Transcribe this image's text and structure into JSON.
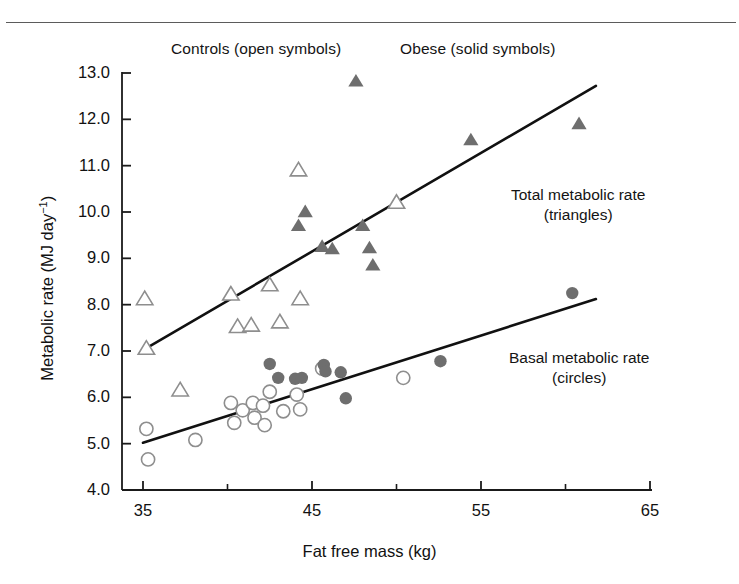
{
  "figure": {
    "legend_controls": "Controls (open symbols)",
    "legend_obese": "Obese (solid symbols)",
    "annotation_total_line1": "Total metabolic rate",
    "annotation_total_line2": "(triangles)",
    "annotation_basal_line1": "Basal metabolic rate",
    "annotation_basal_line2": "(circles)",
    "xlabel": "Fat free mass (kg)",
    "ylabel_main": "Metabolic rate (MJ day",
    "ylabel_sup": "−1",
    "ylabel_close": ")"
  },
  "colors": {
    "axis": "#1a1a1a",
    "text": "#141414",
    "solid_marker": "#6e6e6e",
    "open_marker_stroke": "#8e8e8e",
    "fit_line": "#111111",
    "top_rule": "#5b5b5b",
    "background": "#ffffff"
  },
  "axes": {
    "x_ticks_major": [
      35,
      45,
      55,
      65
    ],
    "x_ticks_minor": [
      40,
      50,
      60
    ],
    "x_tick_labels": [
      "35",
      "45",
      "55",
      "65"
    ],
    "y_ticks": [
      4.0,
      5.0,
      6.0,
      7.0,
      8.0,
      9.0,
      10.0,
      11.0,
      12.0,
      13.0
    ],
    "y_tick_labels": [
      "4.0",
      "5.0",
      "6.0",
      "7.0",
      "8.0",
      "9.0",
      "10.0",
      "11.0",
      "12.0",
      "13.0"
    ],
    "xlim": [
      35,
      65
    ],
    "ylim": [
      4.0,
      13.0
    ],
    "grid": false
  },
  "chart_data": {
    "type": "scatter",
    "title": "",
    "xlabel": "Fat free mass (kg)",
    "ylabel": "Metabolic rate (MJ day−1)",
    "xlim": [
      35,
      65
    ],
    "ylim": [
      4.0,
      13.0
    ],
    "grid": false,
    "legend_position": "top-inside",
    "annotations": [
      {
        "text": "Controls (open symbols)",
        "x": 37.5,
        "y": 13.55
      },
      {
        "text": "Obese (solid symbols)",
        "x": 50.5,
        "y": 13.55
      },
      {
        "text": "Total metabolic rate (triangles)",
        "x": 57.5,
        "y": 10.4
      },
      {
        "text": "Basal metabolic rate (circles)",
        "x": 57.5,
        "y": 7.0
      }
    ],
    "series": [
      {
        "name": "Total metabolic rate — Controls",
        "marker": "triangle",
        "fill": "open",
        "group": "controls",
        "measure": "total",
        "points": [
          {
            "x": 35.1,
            "y": 8.12
          },
          {
            "x": 35.2,
            "y": 7.05
          },
          {
            "x": 37.2,
            "y": 6.15
          },
          {
            "x": 40.2,
            "y": 8.22
          },
          {
            "x": 40.6,
            "y": 7.52
          },
          {
            "x": 41.4,
            "y": 7.55
          },
          {
            "x": 42.5,
            "y": 8.42
          },
          {
            "x": 43.1,
            "y": 7.62
          },
          {
            "x": 44.2,
            "y": 10.9
          },
          {
            "x": 44.3,
            "y": 8.12
          },
          {
            "x": 50.0,
            "y": 10.2
          }
        ]
      },
      {
        "name": "Total metabolic rate — Obese",
        "marker": "triangle",
        "fill": "solid",
        "group": "obese",
        "measure": "total",
        "points": [
          {
            "x": 44.2,
            "y": 9.7
          },
          {
            "x": 44.6,
            "y": 10.0
          },
          {
            "x": 45.6,
            "y": 9.25
          },
          {
            "x": 46.2,
            "y": 9.2
          },
          {
            "x": 47.6,
            "y": 12.82
          },
          {
            "x": 48.0,
            "y": 9.7
          },
          {
            "x": 48.4,
            "y": 9.22
          },
          {
            "x": 48.6,
            "y": 8.85
          },
          {
            "x": 54.4,
            "y": 11.55
          },
          {
            "x": 60.8,
            "y": 11.9
          }
        ]
      },
      {
        "name": "Basal metabolic rate — Controls",
        "marker": "circle",
        "fill": "open",
        "group": "controls",
        "measure": "basal",
        "points": [
          {
            "x": 35.2,
            "y": 5.32
          },
          {
            "x": 35.3,
            "y": 4.66
          },
          {
            "x": 38.1,
            "y": 5.08
          },
          {
            "x": 40.2,
            "y": 5.88
          },
          {
            "x": 40.4,
            "y": 5.45
          },
          {
            "x": 40.9,
            "y": 5.72
          },
          {
            "x": 41.5,
            "y": 5.88
          },
          {
            "x": 41.6,
            "y": 5.56
          },
          {
            "x": 42.1,
            "y": 5.82
          },
          {
            "x": 42.2,
            "y": 5.4
          },
          {
            "x": 42.5,
            "y": 6.12
          },
          {
            "x": 43.3,
            "y": 5.7
          },
          {
            "x": 44.1,
            "y": 6.06
          },
          {
            "x": 44.3,
            "y": 5.74
          },
          {
            "x": 45.6,
            "y": 6.62
          },
          {
            "x": 50.4,
            "y": 6.42
          }
        ]
      },
      {
        "name": "Basal metabolic rate — Obese",
        "marker": "circle",
        "fill": "solid",
        "group": "obese",
        "measure": "basal",
        "points": [
          {
            "x": 42.5,
            "y": 6.72
          },
          {
            "x": 43.0,
            "y": 6.42
          },
          {
            "x": 44.0,
            "y": 6.4
          },
          {
            "x": 44.4,
            "y": 6.42
          },
          {
            "x": 45.7,
            "y": 6.7
          },
          {
            "x": 45.8,
            "y": 6.56
          },
          {
            "x": 46.7,
            "y": 6.54
          },
          {
            "x": 47.0,
            "y": 5.98
          },
          {
            "x": 52.6,
            "y": 6.78
          },
          {
            "x": 60.4,
            "y": 8.25
          }
        ]
      }
    ],
    "fit_lines": [
      {
        "name": "Total metabolic rate regression",
        "x0": 35.0,
        "y0": 7.02,
        "x1": 61.8,
        "y1": 12.72
      },
      {
        "name": "Basal metabolic rate regression",
        "x0": 35.0,
        "y0": 5.02,
        "x1": 61.8,
        "y1": 8.12
      }
    ]
  }
}
